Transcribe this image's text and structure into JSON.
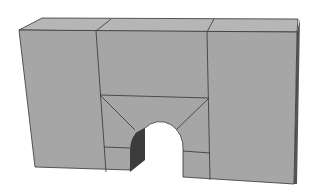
{
  "figure": {
    "colors": {
      "front": "#a4a4a4",
      "top": "#b4b4b4",
      "side": "#3a3a3a",
      "edge": "#333333",
      "background": "#ffffff"
    }
  }
}
